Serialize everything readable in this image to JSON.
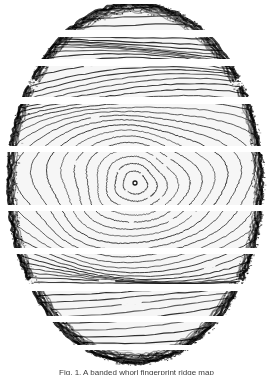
{
  "figure": {
    "kind": "fingerprint-ridge-image",
    "pattern_type": "whorl",
    "caption": "Fig. 1. A banded whorl fingerprint ridge map",
    "width": 273,
    "height": 375,
    "background_color": "#ffffff",
    "ridge_color": "#1a1a1a",
    "edge_color": "#000000",
    "paper_tint": "#fbfbfb"
  },
  "print": {
    "center_x": 135,
    "center_y": 183,
    "oval_left": 8,
    "oval_right": 265,
    "oval_top": 4,
    "oval_bottom": 366,
    "radius_x": 128,
    "radius_y": 181,
    "ridge_spacing": 7.4,
    "ridge_count": 26,
    "core_radius": 4
  },
  "bands": [
    {
      "index": 1,
      "top": 4,
      "bottom": 30,
      "label": "band-1"
    },
    {
      "index": 2,
      "top": 37,
      "bottom": 59,
      "label": "band-2"
    },
    {
      "index": 3,
      "top": 66,
      "bottom": 97,
      "label": "band-3"
    },
    {
      "index": 4,
      "top": 104,
      "bottom": 146,
      "label": "band-4"
    },
    {
      "index": 5,
      "top": 152,
      "bottom": 205,
      "label": "band-5"
    },
    {
      "index": 6,
      "top": 211,
      "bottom": 248,
      "label": "band-6"
    },
    {
      "index": 7,
      "top": 254,
      "bottom": 284,
      "label": "band-7"
    },
    {
      "index": 8,
      "top": 291,
      "bottom": 316,
      "label": "band-8"
    },
    {
      "index": 9,
      "top": 322,
      "bottom": 345,
      "label": "band-9"
    },
    {
      "index": 10,
      "top": 350,
      "bottom": 366,
      "label": "band-10"
    }
  ],
  "chart_data": {
    "type": "heatmap",
    "xlabel": "",
    "ylabel": "",
    "grid": false,
    "legend": "none",
    "xlim": [
      0,
      273
    ],
    "ylim": [
      0,
      375
    ],
    "series": [
      {
        "name": "band-rows",
        "categories": [
          "band-1",
          "band-2",
          "band-3",
          "band-4",
          "band-5",
          "band-6",
          "band-7",
          "band-8",
          "band-9",
          "band-10"
        ],
        "values": [
          26,
          22,
          31,
          42,
          53,
          37,
          30,
          25,
          23,
          16
        ]
      }
    ]
  }
}
